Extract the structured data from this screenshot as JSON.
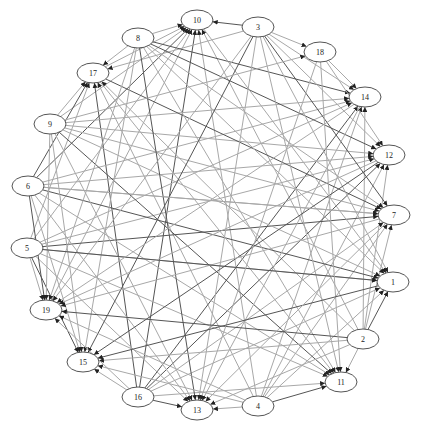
{
  "graph": {
    "type": "directed-circular-graph",
    "colors": {
      "background": "#ffffff",
      "edge_light": "#a8a8a8",
      "edge_dark": "#555555",
      "node_stroke": "#555555",
      "node_fill": "#ffffff",
      "arrow": "#222222"
    },
    "nodes": [
      {
        "id": "10",
        "label": "10",
        "x": 197,
        "y": 20
      },
      {
        "id": "3",
        "label": "3",
        "x": 258,
        "y": 27
      },
      {
        "id": "18",
        "label": "18",
        "x": 320,
        "y": 52
      },
      {
        "id": "14",
        "label": "14",
        "x": 365,
        "y": 97
      },
      {
        "id": "12",
        "label": "12",
        "x": 389,
        "y": 155
      },
      {
        "id": "7",
        "label": "7",
        "x": 394,
        "y": 215
      },
      {
        "id": "1",
        "label": "1",
        "x": 393,
        "y": 282
      },
      {
        "id": "2",
        "label": "2",
        "x": 363,
        "y": 339
      },
      {
        "id": "11",
        "label": "11",
        "x": 341,
        "y": 382
      },
      {
        "id": "4",
        "label": "4",
        "x": 258,
        "y": 406
      },
      {
        "id": "13",
        "label": "13",
        "x": 197,
        "y": 410
      },
      {
        "id": "16",
        "label": "16",
        "x": 138,
        "y": 397
      },
      {
        "id": "15",
        "label": "15",
        "x": 83,
        "y": 362
      },
      {
        "id": "19",
        "label": "19",
        "x": 46,
        "y": 310
      },
      {
        "id": "5",
        "label": "5",
        "x": 27,
        "y": 248
      },
      {
        "id": "6",
        "label": "6",
        "x": 28,
        "y": 186
      },
      {
        "id": "9",
        "label": "9",
        "x": 50,
        "y": 124
      },
      {
        "id": "17",
        "label": "17",
        "x": 93,
        "y": 73
      },
      {
        "id": "8",
        "label": "8",
        "x": 138,
        "y": 38
      }
    ],
    "edges": [
      [
        "3",
        "10"
      ],
      [
        "8",
        "10"
      ],
      [
        "17",
        "10"
      ],
      [
        "9",
        "10"
      ],
      [
        "6",
        "10"
      ],
      [
        "5",
        "10"
      ],
      [
        "2",
        "10"
      ],
      [
        "4",
        "10"
      ],
      [
        "16",
        "10"
      ],
      [
        "19",
        "10"
      ],
      [
        "8",
        "17"
      ],
      [
        "9",
        "17"
      ],
      [
        "6",
        "17"
      ],
      [
        "5",
        "17"
      ],
      [
        "2",
        "17"
      ],
      [
        "4",
        "17"
      ],
      [
        "16",
        "17"
      ],
      [
        "3",
        "17"
      ],
      [
        "3",
        "14"
      ],
      [
        "18",
        "14"
      ],
      [
        "8",
        "14"
      ],
      [
        "9",
        "14"
      ],
      [
        "6",
        "14"
      ],
      [
        "5",
        "14"
      ],
      [
        "16",
        "14"
      ],
      [
        "4",
        "14"
      ],
      [
        "2",
        "14"
      ],
      [
        "3",
        "12"
      ],
      [
        "8",
        "12"
      ],
      [
        "9",
        "12"
      ],
      [
        "6",
        "12"
      ],
      [
        "5",
        "12"
      ],
      [
        "16",
        "12"
      ],
      [
        "4",
        "12"
      ],
      [
        "2",
        "12"
      ],
      [
        "18",
        "12"
      ],
      [
        "3",
        "7"
      ],
      [
        "8",
        "7"
      ],
      [
        "9",
        "7"
      ],
      [
        "6",
        "7"
      ],
      [
        "5",
        "7"
      ],
      [
        "16",
        "7"
      ],
      [
        "4",
        "7"
      ],
      [
        "2",
        "7"
      ],
      [
        "17",
        "7"
      ],
      [
        "3",
        "1"
      ],
      [
        "8",
        "1"
      ],
      [
        "9",
        "1"
      ],
      [
        "6",
        "1"
      ],
      [
        "5",
        "1"
      ],
      [
        "16",
        "1"
      ],
      [
        "4",
        "1"
      ],
      [
        "2",
        "1"
      ],
      [
        "10",
        "1"
      ],
      [
        "3",
        "11"
      ],
      [
        "8",
        "11"
      ],
      [
        "9",
        "11"
      ],
      [
        "6",
        "11"
      ],
      [
        "5",
        "11"
      ],
      [
        "16",
        "11"
      ],
      [
        "4",
        "11"
      ],
      [
        "2",
        "11"
      ],
      [
        "17",
        "11"
      ],
      [
        "3",
        "13"
      ],
      [
        "8",
        "13"
      ],
      [
        "9",
        "13"
      ],
      [
        "6",
        "13"
      ],
      [
        "5",
        "13"
      ],
      [
        "16",
        "13"
      ],
      [
        "4",
        "13"
      ],
      [
        "2",
        "13"
      ],
      [
        "14",
        "13"
      ],
      [
        "3",
        "15"
      ],
      [
        "8",
        "15"
      ],
      [
        "9",
        "15"
      ],
      [
        "6",
        "15"
      ],
      [
        "5",
        "15"
      ],
      [
        "16",
        "15"
      ],
      [
        "4",
        "15"
      ],
      [
        "2",
        "15"
      ],
      [
        "12",
        "15"
      ],
      [
        "3",
        "19"
      ],
      [
        "8",
        "19"
      ],
      [
        "9",
        "19"
      ],
      [
        "6",
        "19"
      ],
      [
        "5",
        "19"
      ],
      [
        "16",
        "19"
      ],
      [
        "4",
        "19"
      ],
      [
        "2",
        "19"
      ],
      [
        "7",
        "19"
      ],
      [
        "3",
        "18"
      ],
      [
        "9",
        "18"
      ],
      [
        "5",
        "1"
      ],
      [
        "6",
        "7"
      ],
      [
        "18",
        "11"
      ],
      [
        "18",
        "13"
      ],
      [
        "1",
        "15"
      ],
      [
        "7",
        "13"
      ],
      [
        "12",
        "19"
      ],
      [
        "14",
        "19"
      ]
    ]
  }
}
